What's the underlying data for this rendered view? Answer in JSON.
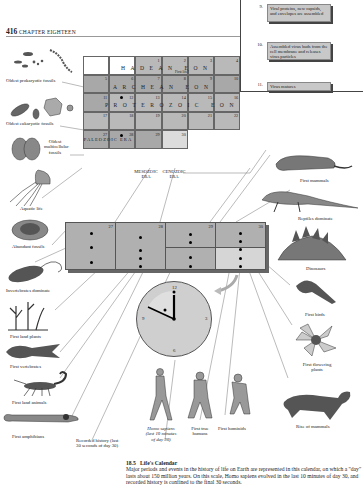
{
  "page": {
    "page_number": "416",
    "chapter": "CHAPTER EIGHTEEN"
  },
  "popup": {
    "steps": [
      {
        "num": "9.",
        "text": "Viral proteins, new capsids, and envelopes are assembled"
      },
      {
        "num": "10.",
        "text": "Assembled virus buds from the cell membrane and releases virus particles"
      },
      {
        "num": "11.",
        "text": "Virus matures"
      }
    ]
  },
  "calendar": {
    "days": [
      "1",
      "2",
      "3",
      "4",
      "5",
      "6",
      "7",
      "8",
      "9",
      "10",
      "11",
      "12",
      "13",
      "14",
      "15",
      "16",
      "17",
      "18",
      "19",
      "20",
      "21",
      "22",
      "23",
      "24",
      "25",
      "26",
      "27",
      "28",
      "29",
      "30"
    ],
    "eons": {
      "hadean": "HADEAN EON",
      "archean": "ARCHEAN EON",
      "proterozoic": "PROTEROZOIC EON"
    },
    "first_life_note": "First life?",
    "paleozoic": "PALEOZOIC ERA",
    "mesozoic": "MESOZOIC ERA",
    "cenozoic": "CENOZOIC ERA"
  },
  "expanded_calendar": {
    "days": [
      "27",
      "28",
      "29",
      "30"
    ]
  },
  "clock": {
    "numbers": [
      "12",
      "3",
      "6",
      "9"
    ]
  },
  "left_labels": {
    "prokaryotic": "Oldest prokaryotic fossils",
    "eukaryotic": "Oldest eukaryotic fossils",
    "multicellular": "Oldest multicellular fossils",
    "aquatic": "Aquatic life",
    "abundant": "Abundant fossils",
    "invertebrates": "Invertebrates dominate",
    "land_plants": "First land plants",
    "vertebrates": "First vertebrates",
    "land_animals": "First land animals",
    "amphibians": "First amphibians",
    "recorded_history": "Recorded history (last 30 seconds of day 30)"
  },
  "bottom_labels": {
    "homo_sapiens": "Homo sapiens (last 10 minutes of day 30)",
    "first_true_humans": "First true humans",
    "first_hominids": "First hominids"
  },
  "right_labels": {
    "first_mammals": "First mammals",
    "reptiles": "Reptiles dominate",
    "dinosaurs": "Dinosaurs",
    "first_birds": "First birds",
    "flowering": "First flowering plants",
    "rise_mammals": "Rise of mammals"
  },
  "caption": {
    "figure": "18.5",
    "title": "Life's Calendar",
    "body": "Major periods and events in the history of life on Earth are represented in this calendar, on which a \"day\" lasts about 150 million years. On this scale, Homo sapiens evolved in the last 10 minutes of day 30, and recorded history is confined to the final 30 seconds."
  }
}
